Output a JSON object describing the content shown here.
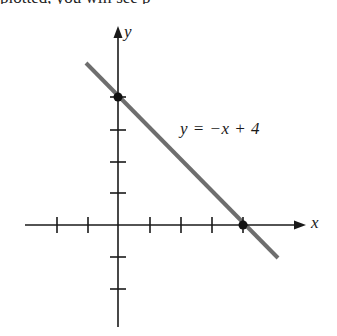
{
  "figure": {
    "cropped_header_text": "plotted, you will see p",
    "axes": {
      "x_label": "x",
      "y_label": "y",
      "unit_px": 31.5,
      "origin_px": [
        118,
        225
      ],
      "x_ticks": [
        -3,
        -2,
        -1,
        1,
        2,
        3,
        4
      ],
      "y_ticks": [
        -2,
        -1,
        1,
        2,
        3,
        4
      ]
    },
    "line": {
      "equation_label": "y = −x + 4",
      "slope": -1,
      "intercept": 4,
      "color": "#6e6e6e",
      "from": [
        -1,
        5
      ],
      "to": [
        5,
        -1
      ]
    },
    "points": [
      {
        "name": "y-intercept",
        "x": 0,
        "y": 4
      },
      {
        "name": "x-intercept",
        "x": 4,
        "y": 0
      }
    ],
    "axis_color": "#1a1a1a"
  }
}
